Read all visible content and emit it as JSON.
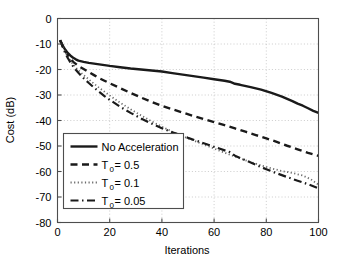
{
  "chart_data": {
    "type": "line",
    "title": "",
    "xlabel": "Iterations",
    "ylabel": "Cost (dB)",
    "xlim": [
      0,
      100
    ],
    "ylim": [
      -80,
      0
    ],
    "xticks": [
      0,
      20,
      40,
      60,
      80,
      100
    ],
    "yticks": [
      0,
      -10,
      -20,
      -30,
      -40,
      -50,
      -60,
      -70,
      -80
    ],
    "xtick_labels": [
      "0",
      "20",
      "40",
      "60",
      "80",
      "100"
    ],
    "ytick_labels": [
      "0",
      "-10",
      "-20",
      "-30",
      "-40",
      "-50",
      "-60",
      "-70",
      "-80"
    ],
    "grid": true,
    "grid_style": "dotted",
    "grid_color": "#bfbfbf",
    "axis_color": "#4d4d4d",
    "background": "#ffffff",
    "legend_position": "lower-left",
    "series": [
      {
        "name": "No Acceleration",
        "label": "No Acceleration",
        "style": "solid",
        "color": "#1a1a1a",
        "width": 2.4,
        "x": [
          1,
          2,
          3,
          4,
          5,
          6,
          7,
          8,
          10,
          12,
          14,
          16,
          18,
          20,
          24,
          28,
          32,
          36,
          40,
          44,
          48,
          52,
          56,
          60,
          64,
          66,
          68,
          70,
          74,
          78,
          82,
          86,
          90,
          92,
          94,
          96,
          98,
          100
        ],
        "y": [
          -8.5,
          -10.6,
          -12.3,
          -13.6,
          -14.6,
          -15.4,
          -16.0,
          -16.5,
          -17.0,
          -17.4,
          -17.7,
          -18.0,
          -18.3,
          -18.6,
          -19.1,
          -19.6,
          -20.0,
          -20.4,
          -20.8,
          -21.4,
          -22.0,
          -22.6,
          -23.2,
          -23.8,
          -24.4,
          -24.8,
          -25.6,
          -26.0,
          -26.9,
          -27.9,
          -29.2,
          -30.6,
          -32.4,
          -33.4,
          -34.2,
          -35.2,
          -36.2,
          -37.0
        ]
      },
      {
        "name": "T0 = 0.5",
        "label_prefix": "T",
        "label_sub": "0",
        "label_suffix": " = 0.5",
        "style": "dashed",
        "color": "#1a1a1a",
        "width": 2.4,
        "x": [
          1,
          2,
          3,
          4,
          5,
          6,
          7,
          8,
          10,
          12,
          14,
          16,
          18,
          20,
          24,
          28,
          32,
          36,
          40,
          44,
          48,
          52,
          56,
          60,
          64,
          68,
          72,
          76,
          80,
          84,
          88,
          92,
          96,
          100
        ],
        "y": [
          -8.5,
          -10.8,
          -12.8,
          -14.4,
          -15.8,
          -17.0,
          -17.8,
          -18.6,
          -19.8,
          -21.0,
          -22.2,
          -23.4,
          -24.4,
          -25.4,
          -27.3,
          -29.2,
          -31.0,
          -32.7,
          -34.2,
          -35.6,
          -36.9,
          -38.2,
          -39.4,
          -40.6,
          -41.8,
          -43.1,
          -44.4,
          -45.7,
          -47.0,
          -48.4,
          -49.9,
          -51.3,
          -52.7,
          -53.9
        ]
      },
      {
        "name": "T0 = 0.1",
        "label_prefix": "T",
        "label_sub": "0",
        "label_suffix": " = 0.1",
        "style": "dotted",
        "color": "#6b6b6b",
        "width": 1.8,
        "x": [
          1,
          2,
          3,
          4,
          5,
          6,
          7,
          8,
          10,
          12,
          14,
          16,
          18,
          20,
          24,
          28,
          32,
          36,
          40,
          44,
          46,
          50,
          54,
          58,
          62,
          66,
          70,
          74,
          78,
          82,
          86,
          90,
          94,
          97,
          100
        ],
        "y": [
          -8.5,
          -11.0,
          -13.2,
          -15.0,
          -16.6,
          -18.0,
          -19.2,
          -20.3,
          -22.2,
          -23.9,
          -25.6,
          -27.2,
          -28.7,
          -30.2,
          -33.0,
          -35.6,
          -38.0,
          -40.3,
          -42.4,
          -44.4,
          -45.3,
          -47.0,
          -48.6,
          -50.2,
          -51.8,
          -53.4,
          -54.9,
          -56.3,
          -57.6,
          -58.8,
          -59.8,
          -60.6,
          -61.6,
          -63.0,
          -65.2
        ]
      },
      {
        "name": "T0 = 0.05",
        "label_prefix": "T",
        "label_sub": "0",
        "label_suffix": " = 0.05",
        "style": "dashdot",
        "color": "#1a1a1a",
        "width": 2.2,
        "x": [
          1,
          2,
          3,
          4,
          5,
          6,
          7,
          8,
          10,
          12,
          14,
          16,
          18,
          20,
          24,
          28,
          32,
          36,
          40,
          44,
          46,
          50,
          54,
          58,
          62,
          66,
          68,
          72,
          76,
          80,
          84,
          88,
          92,
          96,
          100
        ],
        "y": [
          -8.5,
          -11.2,
          -13.6,
          -15.6,
          -17.3,
          -18.8,
          -20.1,
          -21.3,
          -23.4,
          -25.3,
          -27.1,
          -28.8,
          -30.4,
          -31.9,
          -34.6,
          -37.0,
          -39.2,
          -41.2,
          -43.0,
          -44.6,
          -45.3,
          -46.8,
          -48.2,
          -49.6,
          -51.0,
          -52.4,
          -53.8,
          -55.6,
          -57.4,
          -59.1,
          -60.7,
          -62.2,
          -63.6,
          -65.0,
          -66.6
        ]
      }
    ],
    "legend_entries": [
      {
        "label": "No Acceleration",
        "style": "solid"
      },
      {
        "label": "T0 = 0.5",
        "style": "dashed"
      },
      {
        "label": "T0 = 0.1",
        "style": "dotted"
      },
      {
        "label": "T0 = 0.05",
        "style": "dashdot"
      }
    ]
  }
}
